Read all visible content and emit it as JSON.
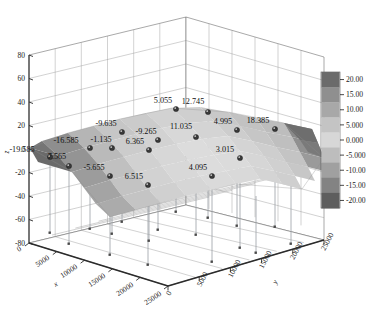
{
  "chart_data": {
    "type": "surface3d",
    "title": "",
    "xlabel": "x",
    "ylabel": "y",
    "zlabel": "z",
    "xlim": [
      0,
      25000
    ],
    "ylim": [
      0,
      25000
    ],
    "zlim": [
      -80,
      80
    ],
    "x_ticks": [
      "0",
      "5000",
      "10000",
      "15000",
      "20000",
      "25000"
    ],
    "y_ticks": [
      "0",
      "5000",
      "10000",
      "15000",
      "20000",
      "25000"
    ],
    "z_ticks": [
      "80",
      "60",
      "40",
      "20",
      "0",
      "-20",
      "-40",
      "-60",
      "-80"
    ],
    "grid": true,
    "colormap": "grayscale",
    "colorbar": {
      "position": "right",
      "ticks": [
        "20.00",
        "15.00",
        "10.00",
        "5.000",
        "0.000",
        "-5.000",
        "-10.00",
        "-15.00",
        "-20.00"
      ],
      "vmin": -20.0,
      "vmax": 20.0
    },
    "point_labels": [
      "-19.585",
      "7.565",
      "-16.585",
      "-1.135",
      "-9.635",
      "-5.655",
      "6.365",
      "6.515",
      "-9.265",
      "5.055",
      "12.745",
      "11.035",
      "4.095",
      "4.995",
      "3.015",
      "18.385"
    ],
    "points": [
      {
        "label": "-19.585",
        "value": -19.585,
        "px": 50,
        "py": 157,
        "lx": 22,
        "ly": 152
      },
      {
        "label": "7.565",
        "value": 7.565,
        "px": 69,
        "py": 166,
        "lx": 57,
        "ly": 159
      },
      {
        "label": "-16.585",
        "value": -16.585,
        "px": 90,
        "py": 148,
        "lx": 66,
        "ly": 143
      },
      {
        "label": "-1.135",
        "value": -1.135,
        "px": 112,
        "py": 148,
        "lx": 101,
        "ly": 142
      },
      {
        "label": "-9.635",
        "value": -9.635,
        "px": 122,
        "py": 132,
        "lx": 106,
        "ly": 126
      },
      {
        "label": "-5.655",
        "value": -5.655,
        "px": 110,
        "py": 176,
        "lx": 94,
        "ly": 170
      },
      {
        "label": "6.365",
        "value": 6.365,
        "px": 149,
        "py": 150,
        "lx": 135,
        "ly": 144
      },
      {
        "label": "6.515",
        "value": 6.515,
        "px": 148,
        "py": 185,
        "lx": 134,
        "ly": 179
      },
      {
        "label": "-9.265",
        "value": -9.265,
        "px": 158,
        "py": 140,
        "lx": 146,
        "ly": 134
      },
      {
        "label": "5.055",
        "value": 5.055,
        "px": 176,
        "py": 109,
        "lx": 163,
        "ly": 103
      },
      {
        "label": "12.745",
        "value": 12.745,
        "px": 208,
        "py": 112,
        "lx": 193,
        "ly": 104
      },
      {
        "label": "11.035",
        "value": 11.035,
        "px": 196,
        "py": 137,
        "lx": 181,
        "ly": 129
      },
      {
        "label": "4.095",
        "value": 4.095,
        "px": 212,
        "py": 176,
        "lx": 198,
        "ly": 170
      },
      {
        "label": "4.995",
        "value": 4.995,
        "px": 237,
        "py": 130,
        "lx": 223,
        "ly": 124
      },
      {
        "label": "3.015",
        "value": 3.015,
        "px": 240,
        "py": 158,
        "lx": 225,
        "ly": 152
      },
      {
        "label": "18.385",
        "value": 18.385,
        "px": 275,
        "py": 129,
        "lx": 258,
        "ly": 123
      }
    ]
  },
  "colors": {
    "axis": "#2b2b2b",
    "grid": "#9a9a9a",
    "marker": "#3a3a3a",
    "dropline": "#9aa0a5",
    "background": "#ffffff",
    "cb_20": "#6b6b6b",
    "cb_15": "#8f8f8f",
    "cb_10": "#a8a8a8",
    "cb_5": "#c4c4c4",
    "cb_0": "#d7d7d7",
    "cb_m5": "#bdbdbd",
    "cb_m10": "#a0a0a0",
    "cb_m15": "#838383",
    "cb_m20": "#5e5e5e"
  }
}
